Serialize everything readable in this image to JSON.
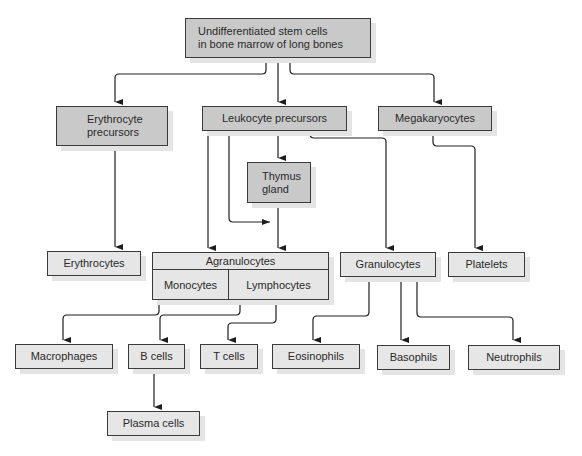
{
  "diagram": {
    "nodes": {
      "stem_cells": "Undifferentiated stem cells\nin bone marrow of long bones",
      "erythrocyte_precursors": "Erythrocyte\nprecursors",
      "leukocyte_precursors": "Leukocyte precursors",
      "megakaryocytes": "Megakaryocytes",
      "thymus_gland": "Thymus\ngland",
      "erythrocytes": "Erythrocytes",
      "agranulocytes": "Agranulocytes",
      "monocytes": "Monocytes",
      "lymphocytes": "Lymphocytes",
      "granulocytes": "Granulocytes",
      "platelets": "Platelets",
      "macrophages": "Macrophages",
      "b_cells": "B cells",
      "t_cells": "T cells",
      "eosinophils": "Eosinophils",
      "basophils": "Basophils",
      "neutrophils": "Neutrophils",
      "plasma_cells": "Plasma cells"
    },
    "edges": [
      [
        "stem_cells",
        "erythrocyte_precursors"
      ],
      [
        "stem_cells",
        "leukocyte_precursors"
      ],
      [
        "stem_cells",
        "megakaryocytes"
      ],
      [
        "erythrocyte_precursors",
        "erythrocytes"
      ],
      [
        "leukocyte_precursors",
        "thymus_gland"
      ],
      [
        "leukocyte_precursors",
        "agranulocytes"
      ],
      [
        "leukocyte_precursors",
        "thymus_gland (via side path)"
      ],
      [
        "leukocyte_precursors",
        "granulocytes"
      ],
      [
        "thymus_gland",
        "lymphocytes"
      ],
      [
        "megakaryocytes",
        "platelets"
      ],
      [
        "monocytes",
        "macrophages"
      ],
      [
        "lymphocytes",
        "b_cells"
      ],
      [
        "lymphocytes",
        "t_cells"
      ],
      [
        "b_cells",
        "plasma_cells"
      ],
      [
        "granulocytes",
        "eosinophils"
      ],
      [
        "granulocytes",
        "basophils"
      ],
      [
        "granulocytes",
        "neutrophils"
      ]
    ],
    "colors": {
      "precursor_fill": "#c9c9c9",
      "mature_fill": "#e6e6e6",
      "border": "#3a3a3a",
      "shadow": "#e4e4e4"
    }
  }
}
